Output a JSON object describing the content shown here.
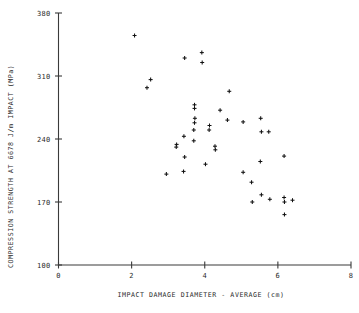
{
  "chart_data": {
    "type": "scatter",
    "title": "",
    "xlabel": "IMPACT DAMAGE DIAMETER - AVERAGE (cm)",
    "ylabel": "COMPRESSION STRENGTH AT 6678 J/m IMPACT (MPa)",
    "xlim": [
      0,
      8
    ],
    "ylim": [
      100,
      380
    ],
    "xticks": [
      0,
      2,
      4,
      6,
      8
    ],
    "xticklabels": [
      "0",
      "2",
      "4",
      "6",
      "8"
    ],
    "yticks": [
      100,
      170,
      240,
      310,
      380
    ],
    "yticklabels": [
      "100",
      "170",
      "240",
      "310",
      "380"
    ],
    "grid": false,
    "legend": null,
    "marker": "plus",
    "marker_color": "#111111",
    "points": [
      {
        "x": 2.08,
        "y": 355
      },
      {
        "x": 2.52,
        "y": 306
      },
      {
        "x": 2.42,
        "y": 297
      },
      {
        "x": 3.45,
        "y": 330
      },
      {
        "x": 3.92,
        "y": 336
      },
      {
        "x": 3.93,
        "y": 325
      },
      {
        "x": 4.67,
        "y": 293
      },
      {
        "x": 3.72,
        "y": 278
      },
      {
        "x": 3.72,
        "y": 274
      },
      {
        "x": 4.42,
        "y": 272
      },
      {
        "x": 3.73,
        "y": 263
      },
      {
        "x": 3.72,
        "y": 258
      },
      {
        "x": 4.62,
        "y": 261
      },
      {
        "x": 5.05,
        "y": 259
      },
      {
        "x": 5.53,
        "y": 263
      },
      {
        "x": 4.13,
        "y": 255
      },
      {
        "x": 4.12,
        "y": 250
      },
      {
        "x": 3.7,
        "y": 250
      },
      {
        "x": 5.55,
        "y": 248
      },
      {
        "x": 5.75,
        "y": 248
      },
      {
        "x": 3.43,
        "y": 243
      },
      {
        "x": 3.7,
        "y": 238
      },
      {
        "x": 3.23,
        "y": 234
      },
      {
        "x": 3.22,
        "y": 231
      },
      {
        "x": 4.28,
        "y": 232
      },
      {
        "x": 4.29,
        "y": 228
      },
      {
        "x": 3.45,
        "y": 220
      },
      {
        "x": 6.17,
        "y": 221
      },
      {
        "x": 4.02,
        "y": 212
      },
      {
        "x": 5.52,
        "y": 215
      },
      {
        "x": 3.42,
        "y": 204
      },
      {
        "x": 2.95,
        "y": 201
      },
      {
        "x": 5.05,
        "y": 203
      },
      {
        "x": 5.28,
        "y": 192
      },
      {
        "x": 5.55,
        "y": 178
      },
      {
        "x": 5.78,
        "y": 173
      },
      {
        "x": 6.17,
        "y": 175
      },
      {
        "x": 6.18,
        "y": 170
      },
      {
        "x": 6.4,
        "y": 172
      },
      {
        "x": 5.3,
        "y": 170
      },
      {
        "x": 6.18,
        "y": 156
      }
    ]
  }
}
